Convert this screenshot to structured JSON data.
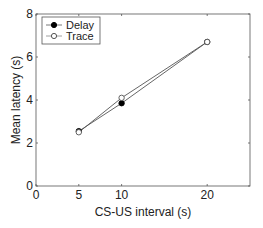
{
  "chart_data": {
    "type": "line",
    "title": "",
    "xlabel": "CS-US interval (s)",
    "ylabel": "Mean latency (s)",
    "xlim": [
      0,
      25
    ],
    "ylim": [
      0,
      8
    ],
    "xticks": [
      0,
      5,
      10,
      20
    ],
    "yticks": [
      0,
      2,
      4,
      6,
      8
    ],
    "grid": false,
    "legend_position": "upper left",
    "x": [
      5,
      10,
      20
    ],
    "series": [
      {
        "name": "Delay",
        "marker": "filled-circle",
        "values": [
          2.55,
          3.85,
          6.7
        ]
      },
      {
        "name": "Trace",
        "marker": "open-circle",
        "values": [
          2.5,
          4.1,
          6.7
        ]
      }
    ]
  },
  "legend": {
    "items": [
      "Delay",
      "Trace"
    ]
  },
  "axes": {
    "xlabel": "CS-US interval (s)",
    "ylabel": "Mean latency (s)"
  }
}
